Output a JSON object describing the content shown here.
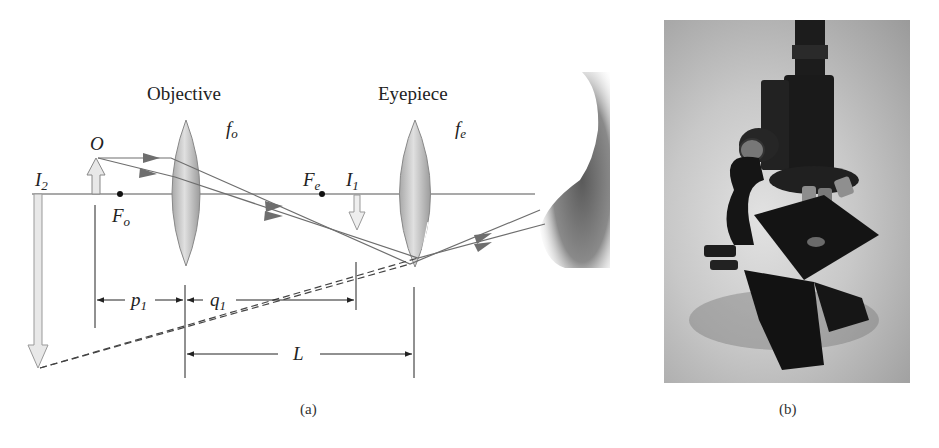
{
  "figure": {
    "panel_a": {
      "caption": "(a)",
      "labels": {
        "objective": "Objective",
        "eyepiece": "Eyepiece",
        "f_o": "f",
        "f_o_sub": "o",
        "f_e": "f",
        "f_e_sub": "e",
        "object": "O",
        "I2": "I",
        "I2_sub": "2",
        "I1": "I",
        "I1_sub": "1",
        "Fo": "F",
        "Fo_sub": "o",
        "Fe": "F",
        "Fe_sub": "e",
        "p1": "p",
        "p1_sub": "1",
        "q1": "q",
        "q1_sub": "1",
        "L": "L"
      },
      "colors": {
        "lens_fill": "#c9c9c9",
        "ray": "#6e6e6e",
        "arrow_fill": "#e8e8e8",
        "axis": "#555555"
      }
    },
    "panel_b": {
      "caption": "(b)",
      "description": "photograph of a compound microscope"
    }
  }
}
